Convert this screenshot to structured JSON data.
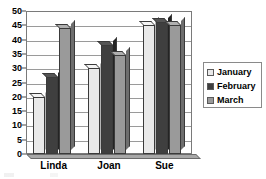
{
  "chart_data": {
    "type": "bar",
    "title": "",
    "subtitle": "",
    "xlabel": "",
    "ylabel": "",
    "categories": [
      "Linda",
      "Joan",
      "Sue"
    ],
    "series": [
      {
        "name": "January",
        "values": [
          20,
          30,
          45
        ],
        "color": "#e9e9e9"
      },
      {
        "name": "February",
        "values": [
          27,
          38,
          46
        ],
        "color": "#3f3f3f"
      },
      {
        "name": "March",
        "values": [
          44,
          34.5,
          45
        ],
        "color": "#9a9a9a"
      }
    ],
    "ylim": [
      0,
      50
    ],
    "ytick_values": [
      0,
      5,
      10,
      15,
      20,
      25,
      30,
      35,
      40,
      45,
      50
    ],
    "ytick_labels": [
      "0",
      "5",
      "10",
      "15",
      "20",
      "25",
      "30",
      "35",
      "40",
      "45",
      "50"
    ],
    "grid": true,
    "grid_axis": "y",
    "legend_position": "right",
    "bar_style": "3d-grouped"
  },
  "legend": {
    "items": [
      {
        "label": "January",
        "swatch": "#e9e9e9"
      },
      {
        "label": "February",
        "swatch": "#3f3f3f"
      },
      {
        "label": "March",
        "swatch": "#9a9a9a"
      }
    ]
  },
  "axes": {
    "x_categories": [
      "Linda",
      "Joan",
      "Sue"
    ],
    "y_ticks": [
      "0",
      "5",
      "10",
      "15",
      "20",
      "25",
      "30",
      "35",
      "40",
      "45",
      "50"
    ]
  }
}
